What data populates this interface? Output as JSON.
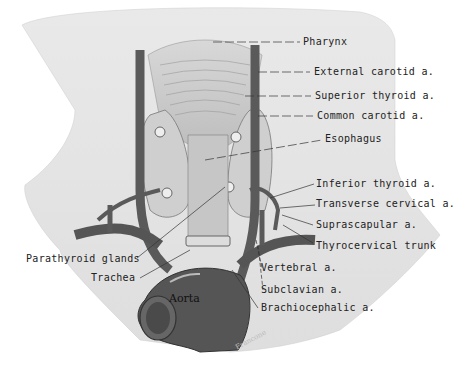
{
  "figure": {
    "colors": {
      "background": "#ffffff",
      "neck_skin": "#e6e6e6",
      "vessel": "#5a5a5a",
      "vessel_highlight": "#8a8a8a",
      "gland": "#cfcfcf",
      "label_text": "#222222"
    },
    "labels_right": [
      {
        "id": "pharynx",
        "text": "Pharynx"
      },
      {
        "id": "external-carotid",
        "text": "External carotid a."
      },
      {
        "id": "superior-thyroid",
        "text": "Superior thyroid a."
      },
      {
        "id": "common-carotid",
        "text": "Common carotid a."
      },
      {
        "id": "esophagus",
        "text": "Esophagus"
      },
      {
        "id": "inferior-thyroid",
        "text": "Inferior thyroid a."
      },
      {
        "id": "transverse-cervical",
        "text": "Transverse cervical a."
      },
      {
        "id": "suprascapular",
        "text": "Suprascapular a."
      },
      {
        "id": "thyrocervical-trunk",
        "text": "Thyrocervical trunk"
      },
      {
        "id": "vertebral",
        "text": "Vertebral a."
      },
      {
        "id": "subclavian",
        "text": "Subclavian a."
      },
      {
        "id": "brachiocephalic",
        "text": "Brachiocephalic a."
      }
    ],
    "labels_left": [
      {
        "id": "parathyroid-glands",
        "text": "Parathyroid glands"
      },
      {
        "id": "trachea",
        "text": "Trachea"
      }
    ],
    "inline_labels": {
      "aorta": "Aorta"
    },
    "signature": "Francone"
  }
}
